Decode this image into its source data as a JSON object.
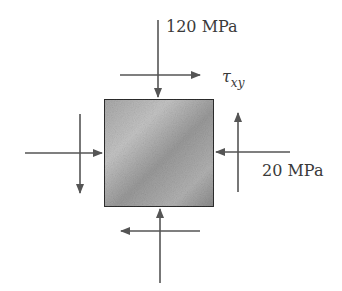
{
  "diagram": {
    "type": "plane-stress-element",
    "element": {
      "fill_colors": [
        "#c9c9c9",
        "#8f8f8f"
      ],
      "border_color": "#2e2e2e"
    },
    "arrow_color": "#555555",
    "labels": {
      "normal_y": "120 MPa",
      "shear": "τ",
      "shear_subscript": "xy",
      "normal_x": "20 MPa"
    }
  }
}
